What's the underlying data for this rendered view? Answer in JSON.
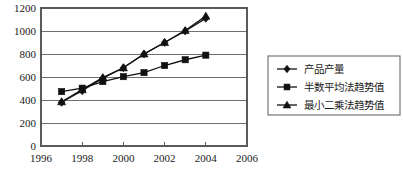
{
  "chart_data": {
    "type": "line",
    "title": "",
    "xlabel": "",
    "ylabel": "",
    "xlim": [
      1996,
      2006
    ],
    "ylim": [
      0,
      1200
    ],
    "grid": true,
    "legend_position": "right",
    "x": [
      1997,
      1998,
      1999,
      2000,
      2001,
      2002,
      2003,
      2004
    ],
    "xticks": [
      "1996",
      "1998",
      "2000",
      "2002",
      "2004",
      "2006"
    ],
    "xtick_values": [
      1996,
      1998,
      2000,
      2002,
      2004,
      2006
    ],
    "yticks": [
      "0",
      "200",
      "400",
      "600",
      "800",
      "1000",
      "1200"
    ],
    "ytick_values": [
      0,
      200,
      400,
      600,
      800,
      1000,
      1200
    ],
    "series": [
      {
        "name": "产品产量",
        "marker": "diamond",
        "color": "#111111",
        "values": [
          380,
          480,
          590,
          680,
          800,
          900,
          1000,
          1110
        ]
      },
      {
        "name": "半数平均法趋势值",
        "marker": "square",
        "color": "#111111",
        "values": [
          473,
          503,
          560,
          603,
          638,
          700,
          750,
          790
        ]
      },
      {
        "name": "最小二乘法趋势值",
        "marker": "triangle",
        "color": "#111111",
        "values": [
          385,
          490,
          595,
          680,
          800,
          900,
          1005,
          1130
        ]
      }
    ]
  },
  "legend": {
    "entries": [
      {
        "label": "产品产量",
        "marker": "diamond"
      },
      {
        "label": "半数平均法趋势值",
        "marker": "square"
      },
      {
        "label": "最小二乘法趋势值",
        "marker": "triangle"
      }
    ]
  }
}
